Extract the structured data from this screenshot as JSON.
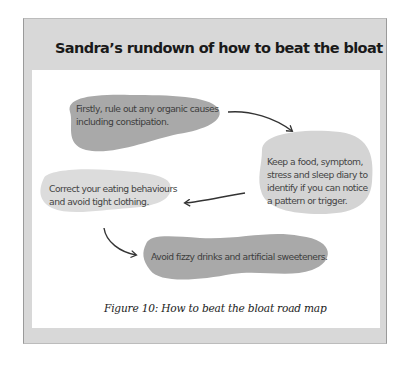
{
  "title": "Sandra’s rundown of how to beat the bloat",
  "steps": [
    {
      "id": 1,
      "lines": [
        "Firstly, rule out any organic causes",
        "including constipation."
      ],
      "fill": "#a9a9a9"
    },
    {
      "id": 2,
      "lines": [
        "Keep a food, symptom,",
        "stress and sleep diary to",
        "identify if you can notice",
        "a pattern or trigger."
      ],
      "fill": "#d4d4d4"
    },
    {
      "id": 3,
      "lines": [
        "Correct your eating behaviours",
        "and avoid tight clothing."
      ],
      "fill": "#dcdcdc"
    },
    {
      "id": 4,
      "lines": [
        "Avoid fizzy drinks and artificial sweeteners."
      ],
      "fill": "#a9a9a9"
    }
  ],
  "flow": [
    "1 → 2",
    "2 → 3",
    "3 → 4"
  ],
  "caption": "Figure 10: How to beat the bloat road map",
  "colors": {
    "panel": "#d8d8d8",
    "dark_blob": "#a9a9a9",
    "light_blob": "#d6d6d6",
    "arrow": "#333333"
  }
}
